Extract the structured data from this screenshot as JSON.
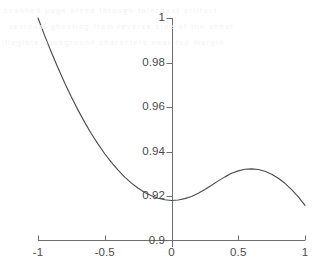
{
  "chart_data": {
    "type": "line",
    "title": "",
    "xlabel": "",
    "ylabel": "",
    "xlim": [
      -1,
      1
    ],
    "ylim": [
      0.9,
      1.0
    ],
    "grid": false,
    "legend": null,
    "xticks": [
      -1,
      -0.5,
      0,
      0.5,
      1
    ],
    "xtick_labels": [
      "-1",
      "-0.5",
      "0",
      "0.5",
      "1"
    ],
    "yticks": [
      0.9,
      0.92,
      0.94,
      0.96,
      0.98,
      1
    ],
    "ytick_labels": [
      "0.9",
      "0.92",
      "0.94",
      "0.96",
      "0.98",
      "1"
    ],
    "series": [
      {
        "name": "curve",
        "color": "#4d4d4d",
        "x": [
          -1.0,
          -0.95,
          -0.9,
          -0.85,
          -0.8,
          -0.75,
          -0.7,
          -0.65,
          -0.6,
          -0.55,
          -0.5,
          -0.45,
          -0.4,
          -0.35,
          -0.3,
          -0.25,
          -0.2,
          -0.15,
          -0.1,
          -0.05,
          0.0,
          0.05,
          0.1,
          0.15,
          0.2,
          0.25,
          0.3,
          0.35,
          0.4,
          0.45,
          0.5,
          0.55,
          0.6,
          0.65,
          0.7,
          0.75,
          0.8,
          0.85,
          0.9,
          0.95,
          1.0
        ],
        "y": [
          1.0,
          0.9921,
          0.9846,
          0.9775,
          0.9708,
          0.9645,
          0.9586,
          0.9531,
          0.948,
          0.9433,
          0.939,
          0.9351,
          0.9316,
          0.9285,
          0.9258,
          0.9235,
          0.9216,
          0.9201,
          0.919,
          0.9183,
          0.918,
          0.9182,
          0.9188,
          0.9198,
          0.9212,
          0.9229,
          0.9248,
          0.9268,
          0.9286,
          0.9302,
          0.9313,
          0.932,
          0.9322,
          0.9319,
          0.9311,
          0.9298,
          0.928,
          0.9257,
          0.9229,
          0.9196,
          0.9158
        ]
      }
    ],
    "annotations": {
      "minimum": {
        "x": 0.0,
        "y": 0.918
      },
      "local_maximum": {
        "x": 0.6,
        "y": 0.9322
      }
    }
  },
  "axes": {
    "x_axis_y_value": 0.9,
    "y_axis_x_value": 0,
    "axis_color": "#6e6e6e"
  },
  "background_noise": {
    "line1": "scanned page bleed through faint text artifact",
    "line2": "residual ghosting from reverse side of the sheet",
    "line3": "illegible background characters near top margin"
  }
}
